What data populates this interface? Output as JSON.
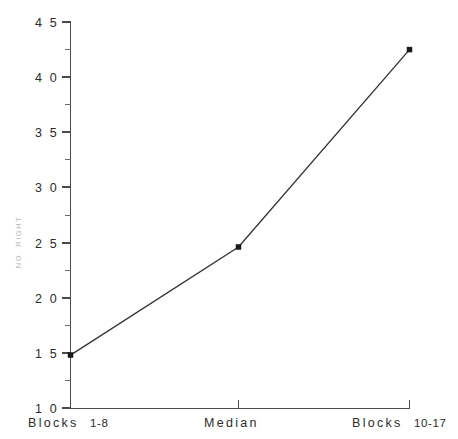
{
  "chart_data": {
    "type": "line",
    "title": "",
    "subtitle": "",
    "xlabel": "",
    "ylabel": "NO. RIGHT",
    "categories": [
      "Blocks 1-8",
      "Median",
      "Blocks 10-17"
    ],
    "x": [
      0,
      1,
      2
    ],
    "values": [
      14.8,
      24.6,
      42.5
    ],
    "series": [
      {
        "name": "NO. RIGHT",
        "values": [
          14.8,
          24.6,
          42.5
        ],
        "marker": "square",
        "marker_color": "#1a1a1a",
        "line_color": "#333333"
      }
    ],
    "ylim": [
      10,
      45
    ],
    "xlim": [
      0,
      2
    ],
    "y_major_ticks": [
      10,
      15,
      20,
      25,
      30,
      35,
      40,
      45
    ],
    "y_minor_ticks": [
      12.5,
      17.5,
      22.5,
      27.5,
      32.5,
      37.5,
      42.5
    ],
    "y_tick_labels": [
      "1 0",
      "1 5",
      "2 0",
      "2 5",
      "3 0",
      "3 5",
      "4 0",
      "4 5"
    ],
    "grid": false,
    "legend": null,
    "legend_position": "none",
    "annotations": []
  },
  "axes": {
    "y_label": "NO. RIGHT",
    "y_ticks": [
      {
        "value": 45,
        "label": "4 5"
      },
      {
        "value": 40,
        "label": "4 0"
      },
      {
        "value": 35,
        "label": "3 5"
      },
      {
        "value": 30,
        "label": "3 0"
      },
      {
        "value": 25,
        "label": "2 5"
      },
      {
        "value": 20,
        "label": "2 0"
      },
      {
        "value": 15,
        "label": "1 5"
      },
      {
        "value": 10,
        "label": "1 0"
      }
    ],
    "x_ticks": [
      {
        "index": 0,
        "lead": "Blocks",
        "trail": "1-8"
      },
      {
        "index": 1,
        "lead": "Median",
        "trail": ""
      },
      {
        "index": 2,
        "lead": "Blocks",
        "trail": "10-17"
      }
    ]
  },
  "colors": {
    "axis": "#4a4a4a",
    "line": "#333333",
    "marker": "#1a1a1a",
    "tick_text": "#2b2b2b",
    "axis_label": "#b9b9b9",
    "background": "#ffffff"
  }
}
